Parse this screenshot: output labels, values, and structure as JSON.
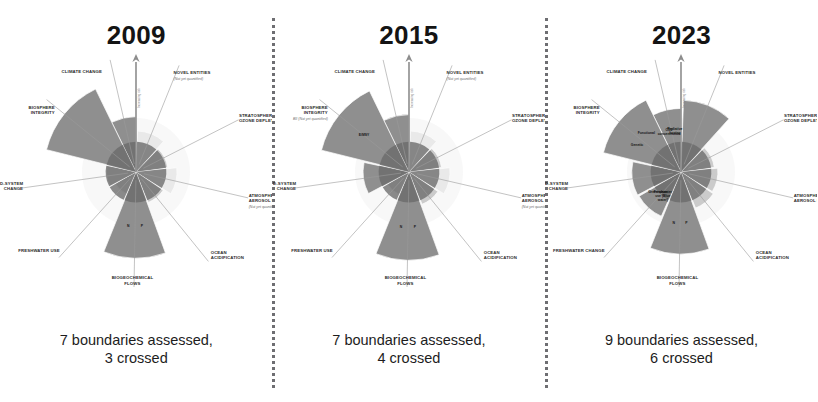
{
  "figure": {
    "type": "radial-wedge-diagram",
    "panel_count": 3,
    "colors": {
      "safe_zone": "#c9c9c9",
      "beyond_boundary": "#8a8a8a",
      "high_risk": "#6a6a6a",
      "not_quantified": "#e4e4e4",
      "boundary_ring": "#f2f2f2",
      "text": "#1d1d1d",
      "divider": "#55555a"
    }
  },
  "panels": [
    {
      "year": "2009",
      "caption_line1": "7 boundaries assessed,",
      "caption_line2": "3 crossed",
      "assessed": 7,
      "crossed": 3,
      "axis_arrow_label": "Increasing risk",
      "boundaries": [
        {
          "name": "CLIMATE CHANGE",
          "sub": "",
          "note": "",
          "status": "crossed",
          "extent": 1.35
        },
        {
          "name": "NOVEL ENTITIES",
          "sub": "",
          "note": "(Not yet quantified)",
          "status": "not-quantified",
          "extent": 1.0
        },
        {
          "name": "STRATOSPHERIC OZONE DEPLETION",
          "sub": "",
          "note": "",
          "status": "safe",
          "extent": 0.78
        },
        {
          "name": "ATMOSPHERIC AEROSOL LOADING",
          "sub": "",
          "note": "(Not yet quantified)",
          "status": "not-quantified",
          "extent": 1.0
        },
        {
          "name": "OCEAN ACIDIFICATION",
          "sub": "",
          "note": "",
          "status": "safe",
          "extent": 0.8
        },
        {
          "name": "BIOGEOCHEMICAL FLOWS",
          "sub": "P  |  N",
          "note": "",
          "status": "crossed",
          "extent": 2.1
        },
        {
          "name": "FRESHWATER USE",
          "sub": "",
          "note": "",
          "status": "safe",
          "extent": 0.58
        },
        {
          "name": "LAND-SYSTEM CHANGE",
          "sub": "",
          "note": "",
          "status": "safe",
          "extent": 0.72
        },
        {
          "name": "BIOSPHERE INTEGRITY",
          "sub": "",
          "note": "",
          "status": "crossed",
          "extent": 2.25
        }
      ]
    },
    {
      "year": "2015",
      "caption_line1": "7 boundaries assessed,",
      "caption_line2": "4 crossed",
      "assessed": 7,
      "crossed": 4,
      "axis_arrow_label": "Increasing risk",
      "boundaries": [
        {
          "name": "CLIMATE CHANGE",
          "sub": "",
          "note": "",
          "status": "crossed",
          "extent": 1.4
        },
        {
          "name": "NOVEL ENTITIES",
          "sub": "",
          "note": "(Not yet quantified)",
          "status": "not-quantified",
          "extent": 1.0
        },
        {
          "name": "STRATOSPHERIC OZONE DEPLETION",
          "sub": "",
          "note": "",
          "status": "safe",
          "extent": 0.8
        },
        {
          "name": "ATMOSPHERIC AEROSOL LOADING",
          "sub": "",
          "note": "(Not yet quantified)",
          "status": "not-quantified",
          "extent": 1.0
        },
        {
          "name": "OCEAN ACIDIFICATION",
          "sub": "",
          "note": "",
          "status": "safe",
          "extent": 0.85
        },
        {
          "name": "BIOGEOCHEMICAL FLOWS",
          "sub": "P  |  N",
          "note": "",
          "status": "crossed",
          "extent": 2.15
        },
        {
          "name": "FRESHWATER USE",
          "sub": "",
          "note": "",
          "status": "safe",
          "extent": 0.6
        },
        {
          "name": "LAND-SYSTEM CHANGE",
          "sub": "",
          "note": "",
          "status": "crossed",
          "extent": 1.12
        },
        {
          "name": "BIOSPHERE INTEGRITY",
          "sub": "E/MSY",
          "note": "BII (Not yet quantified)",
          "status": "crossed",
          "extent": 2.2
        }
      ]
    },
    {
      "year": "2023",
      "caption_line1": "9 boundaries assessed,",
      "caption_line2": "6 crossed",
      "assessed": 9,
      "crossed": 6,
      "axis_arrow_label": "Increasing risk",
      "boundaries": [
        {
          "name": "CLIMATE CHANGE",
          "sub": "CO2 concentration  |  Radiative forcing",
          "note": "",
          "status": "crossed",
          "extent": 1.55
        },
        {
          "name": "NOVEL ENTITIES",
          "sub": "",
          "note": "",
          "status": "crossed",
          "extent": 1.75
        },
        {
          "name": "STRATOSPHERIC OZONE DEPLETION",
          "sub": "",
          "note": "",
          "status": "safe",
          "extent": 0.82
        },
        {
          "name": "ATMOSPHERIC AEROSOL LOADING",
          "sub": "",
          "note": "",
          "status": "safe",
          "extent": 0.9
        },
        {
          "name": "OCEAN ACIDIFICATION",
          "sub": "",
          "note": "",
          "status": "safe",
          "extent": 0.95
        },
        {
          "name": "BIOGEOCHEMICAL FLOWS",
          "sub": "P  |  N",
          "note": "",
          "status": "crossed",
          "extent": 2.0
        },
        {
          "name": "FRESHWATER CHANGE",
          "sub": "Freshwater use (Blue water)  |  Green water",
          "note": "",
          "status": "crossed",
          "extent": 1.18
        },
        {
          "name": "LAND-SYSTEM CHANGE",
          "sub": "",
          "note": "",
          "status": "crossed",
          "extent": 1.2
        },
        {
          "name": "BIOSPHERE INTEGRITY",
          "sub": "Genetic  |  Functional",
          "note": "",
          "status": "crossed",
          "extent": 1.95
        }
      ]
    }
  ],
  "chart_data": {
    "type": "radar",
    "subtitle": "Boundaries assessed and crossed per assessment year",
    "categories": [
      "CLIMATE CHANGE",
      "NOVEL ENTITIES",
      "STRATOSPHERIC OZONE DEPLETION",
      "ATMOSPHERIC AEROSOL LOADING",
      "OCEAN ACIDIFICATION",
      "BIOGEOCHEMICAL FLOWS",
      "FRESHWATER USE / CHANGE",
      "LAND-SYSTEM CHANGE",
      "BIOSPHERE INTEGRITY"
    ],
    "series": [
      {
        "name": "2009",
        "values": [
          1.35,
          null,
          0.78,
          null,
          0.8,
          2.1,
          0.58,
          0.72,
          2.25
        ],
        "assessed": 7,
        "crossed": 3
      },
      {
        "name": "2015",
        "values": [
          1.4,
          null,
          0.8,
          null,
          0.85,
          2.15,
          0.6,
          1.12,
          2.2
        ],
        "assessed": 7,
        "crossed": 4
      },
      {
        "name": "2023",
        "values": [
          1.55,
          1.75,
          0.82,
          0.9,
          0.95,
          2.0,
          1.18,
          1.2,
          1.95
        ],
        "assessed": 9,
        "crossed": 6
      }
    ],
    "ylabel": "Extent of transgression (1.0 = planetary boundary)",
    "xlabel": "",
    "ylim": [
      0,
      2.4
    ],
    "grid": false,
    "legend": "none",
    "annotations": [
      "7 boundaries assessed, 3 crossed",
      "7 boundaries assessed, 4 crossed",
      "9 boundaries assessed, 6 crossed"
    ]
  }
}
